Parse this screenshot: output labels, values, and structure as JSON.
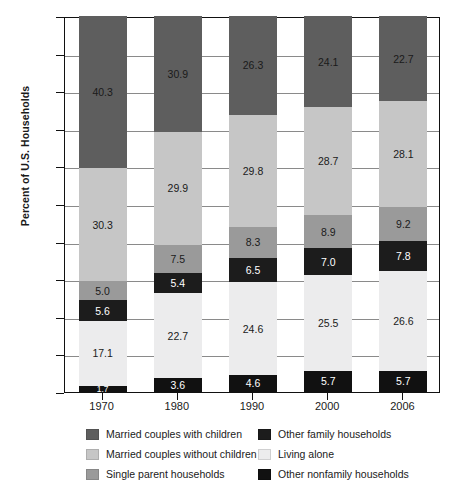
{
  "chart_data": {
    "type": "bar",
    "subtype": "stacked-bar-100-percent",
    "title": "",
    "xlabel": "",
    "ylabel": "Percent of U.S. Households",
    "ylim": [
      0,
      100
    ],
    "ytick_labels": [
      "0",
      "10",
      "20",
      "30",
      "40",
      "50",
      "60",
      "70",
      "80",
      "90",
      "100"
    ],
    "ytick_values": [
      0,
      10,
      20,
      30,
      40,
      50,
      60,
      70,
      80,
      90,
      100
    ],
    "grid": true,
    "legend_position": "bottom",
    "categories": [
      "1970",
      "1980",
      "1990",
      "2000",
      "2006"
    ],
    "series": [
      {
        "name": "Other nonfamily households",
        "color": "#111111",
        "label_color": "light",
        "values": [
          1.7,
          3.6,
          4.6,
          5.7,
          5.7
        ]
      },
      {
        "name": "Living alone",
        "color": "#ececed",
        "label_color": "dark",
        "values": [
          17.1,
          22.7,
          24.6,
          25.5,
          26.6
        ]
      },
      {
        "name": "Other family households",
        "color": "#1c1c1c",
        "label_color": "light",
        "values": [
          5.6,
          5.4,
          6.5,
          7.0,
          7.8
        ]
      },
      {
        "name": "Single parent households",
        "color": "#9a9a9a",
        "label_color": "dark",
        "values": [
          5.0,
          7.5,
          8.3,
          8.9,
          9.2
        ]
      },
      {
        "name": "Married couples without children",
        "color": "#c6c6c6",
        "label_color": "dark",
        "values": [
          30.3,
          29.9,
          29.8,
          28.7,
          28.1
        ]
      },
      {
        "name": "Married couples with children",
        "color": "#5e5e5e",
        "label_color": "dark",
        "values": [
          40.3,
          30.9,
          26.3,
          24.1,
          22.7
        ]
      }
    ]
  },
  "legend": {
    "left_column": [
      {
        "label": "Married couples with children",
        "color": "#5e5e5e"
      },
      {
        "label": "Married couples without children",
        "color": "#c6c6c6"
      },
      {
        "label": "Single parent households",
        "color": "#9a9a9a"
      }
    ],
    "right_column": [
      {
        "label": "Other family households",
        "color": "#1c1c1c"
      },
      {
        "label": "Living alone",
        "color": "#ececed"
      },
      {
        "label": "Other nonfamily households",
        "color": "#111111"
      }
    ]
  }
}
